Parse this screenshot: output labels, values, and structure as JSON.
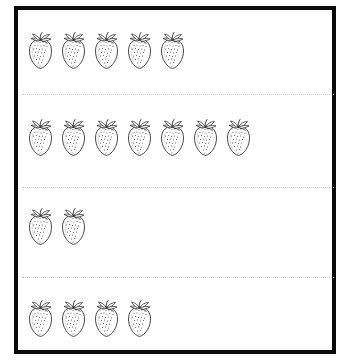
{
  "worksheet": {
    "title": "Strawberry counting rows worksheet",
    "background_color": "#ffffff",
    "frame": {
      "border_color": "#0a0a0a",
      "border_width_px": 4,
      "x": 14,
      "y": 6,
      "width": 322,
      "height": 348
    },
    "separator": {
      "style": "dotted",
      "color": "#c9c9c9"
    },
    "icon_name": "strawberry-icon",
    "icon_outline_color": "#1a1a1a",
    "icon_fill_color": "#ffffff",
    "icon_seed_color": "#555555",
    "rows": [
      {
        "index": 1,
        "label": "row-1",
        "count": 5,
        "top": 22,
        "left": 8,
        "separator_below_top": 84
      },
      {
        "index": 2,
        "label": "row-2",
        "count": 7,
        "top": 109,
        "left": 8,
        "separator_below_top": 177
      },
      {
        "index": 3,
        "label": "row-3",
        "count": 2,
        "top": 198,
        "left": 8,
        "separator_below_top": 267
      },
      {
        "index": 4,
        "label": "row-4",
        "count": 4,
        "top": 290,
        "left": 8,
        "separator_below_top": null
      }
    ]
  }
}
